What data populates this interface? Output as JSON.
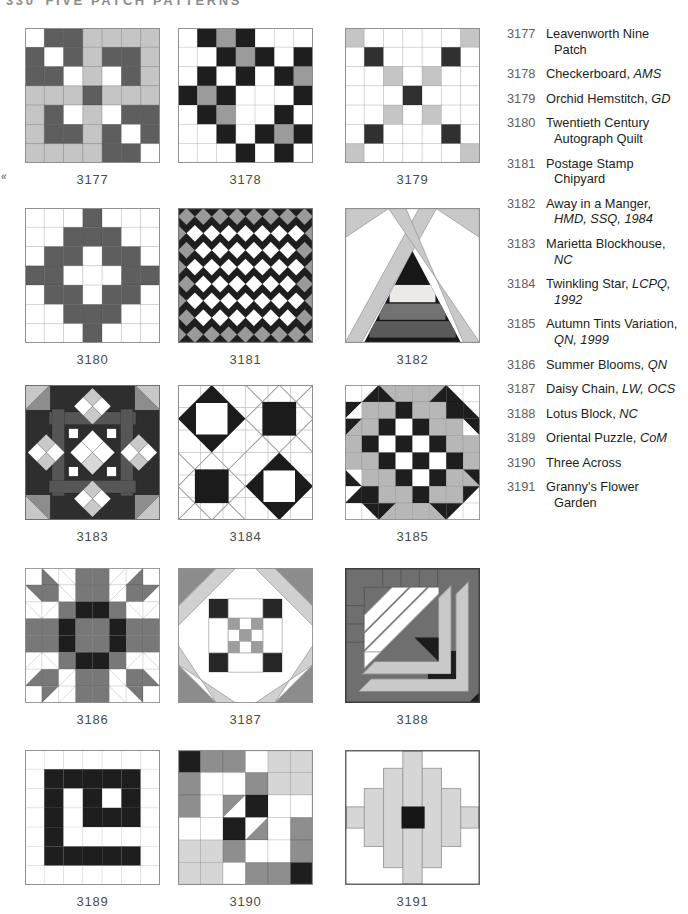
{
  "page_header": {
    "page_number": "330",
    "title": "FIVE PATCH PATTERNS"
  },
  "margin_mark": "«",
  "palette": {
    "w": "#ffffff",
    "k": "#1e1e1e",
    "d": "#5e5e5e",
    "m": "#9b9b9b",
    "b": "#b7b7b7",
    "p": "#787878",
    "g": "#8e8e8e",
    "l": "#c5c5c5",
    "L": "#d6d6d6",
    "c": "#303030",
    "block_bg_dark": "#2e2e2e",
    "bar_gray": "#565656",
    "light_band": "#c9c9c9",
    "ink": "#1d1d1d",
    "number_gray": "#5f5f5f",
    "outline": "#9a9a9a"
  },
  "blocks": [
    {
      "num": "3177",
      "type": "grid",
      "stroke": "#00000030",
      "grid": [
        "w d d l l l l",
        "d w d l d d l",
        "d d w l w d l",
        "l l l d l l l",
        "l d w l w d d",
        "l d d l d w d",
        "l l l l d d w"
      ]
    },
    {
      "num": "3178",
      "type": "grid",
      "stroke": "#00000022",
      "grid": [
        "w k m k w w w",
        "w w k m k w k",
        "w k w k w k m",
        "k m k w w w k",
        "w k m w w k w",
        "w w k w k m k",
        "w w w k w k w"
      ]
    },
    {
      "num": "3179",
      "type": "grid",
      "stroke": "#00000026",
      "grid": [
        "l w w w w w l",
        "w c w w w c w",
        "w w l w l w w",
        "w w w c w w w",
        "w w l w l w w",
        "w c w w w c w",
        "l w w w w w l"
      ]
    },
    {
      "num": "3180",
      "type": "grid",
      "stroke": "#00000026",
      "grid": [
        "w w w d w w w",
        "w w d d d w w",
        "w d d w d d w",
        "d d w w w d d",
        "w d d w d d w",
        "w w d d d w w",
        "w w w d w w w"
      ]
    },
    {
      "num": "3181",
      "type": "diamonds",
      "rows": [
        "gggggggg",
        "gwwwwwwwg",
        "gwwwwwwg",
        "gwwwwwwwg",
        "gwwwwwwg",
        "gwwwwwwwg",
        "gwwwwwwg",
        "ggggggggg"
      ]
    },
    {
      "num": "3182",
      "type": "tent"
    },
    {
      "num": "3183",
      "type": "blockhouse"
    },
    {
      "num": "3184",
      "type": "twinkling"
    },
    {
      "num": "3185",
      "type": "grid",
      "stroke": "#00000026",
      "grid": [
        "w w/k:2 b/k:1 b b b/k:2 w/k:1 w",
        "k/w:2 b b k b b k w/k:1",
        "k/b:2 b k w k b b k/w:1",
        "b k w k w k b b",
        "b b k w k w k b",
        "w/k:1 b b k w k b k/b:1",
        "w/k:2 k b b k b b k/w:2",
        "w k/w:1 k/b:2 b b k/b:1 k/w:2 w"
      ]
    },
    {
      "num": "3186",
      "type": "grid",
      "stroke": "#00000024",
      "grid": [
        "w w/p:1 w/w:1 p p w/w:2 w/p:2 w",
        "p/w:1 p w/w:1 p p w/w:2 p p/w:2",
        "w/w:1 w/w:2 p k k p w/w:1 w/w:2",
        "p p k p p k p p",
        "p p k p p k p p",
        "w/w:2 w/w:1 p k k p w/w:2 w/w:1",
        "w/p:2 p w/w:2 p p w/w:1 p w/p:1",
        "w p/w:2 w/w:2 p p w/w:1 p/w:1 w"
      ]
    },
    {
      "num": "3187",
      "type": "daisy"
    },
    {
      "num": "3188",
      "type": "lotus"
    },
    {
      "num": "3189",
      "type": "grid",
      "stroke": "#00000018",
      "grid": [
        "w w w w w w w",
        "w k k k k k w",
        "w k w k w k w",
        "w k w k k k w",
        "w k w w w w w",
        "w k k k k k w",
        "w w w w w w w"
      ]
    },
    {
      "num": "3190",
      "type": "grid",
      "stroke": "#00000022",
      "grid": [
        "k g g w L L",
        "g w w g L L",
        "g w g/w:2 k w w",
        "w w k w/g:2 w g",
        "L L g w w g",
        "L L w g g k"
      ]
    },
    {
      "num": "3191",
      "type": "garden"
    }
  ],
  "index": {
    "items": [
      {
        "num": "3177",
        "name": "Leavenworth Nine Patch",
        "refs": ""
      },
      {
        "num": "3178",
        "name": "Checkerboard",
        "refs": "AMS"
      },
      {
        "num": "3179",
        "name": "Orchid Hemstitch",
        "refs": "GD"
      },
      {
        "num": "3180",
        "name": "Twentieth Century Autograph Quilt",
        "refs": ""
      },
      {
        "num": "3181",
        "name": "Postage Stamp Chipyard",
        "refs": ""
      },
      {
        "num": "3182",
        "name": "Away in a Manger",
        "refs": "HMD, SSQ, 1984"
      },
      {
        "num": "3183",
        "name": "Marietta Blockhouse",
        "refs": "NC"
      },
      {
        "num": "3184",
        "name": "Twinkling Star",
        "refs": "LCPQ, 1992"
      },
      {
        "num": "3185",
        "name": "Autumn Tints Variation",
        "refs": "QN, 1999"
      },
      {
        "num": "3186",
        "name": "Summer Blooms",
        "refs": "QN"
      },
      {
        "num": "3187",
        "name": "Daisy Chain",
        "refs": "LW, OCS"
      },
      {
        "num": "3188",
        "name": "Lotus Block",
        "refs": "NC"
      },
      {
        "num": "3189",
        "name": "Oriental Puzzle",
        "refs": "CoM"
      },
      {
        "num": "3190",
        "name": "Three Across",
        "refs": ""
      },
      {
        "num": "3191",
        "name": "Granny's Flower Garden",
        "refs": ""
      }
    ]
  }
}
